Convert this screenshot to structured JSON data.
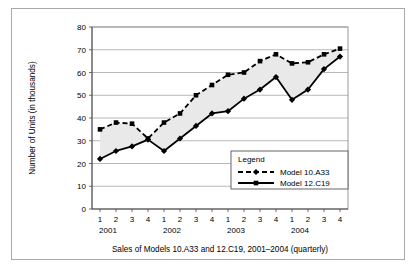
{
  "figure": {
    "caption": "Sales of Models 10.A33 and 12.C19, 2001–2004 (quarterly)",
    "border_color": "#a8a8a8",
    "background": "#ffffff"
  },
  "chart_data": {
    "type": "line",
    "title": "",
    "xlabel": "Sales of Models 10.A33 and 12.C19, 2001–2004 (quarterly)",
    "ylabel": "Number of Units (in thousands)",
    "ylim": [
      0,
      80
    ],
    "ytick_values": [
      0,
      10,
      20,
      30,
      40,
      50,
      60,
      70,
      80
    ],
    "ytick_labels": [
      "0",
      "10",
      "20",
      "30",
      "40",
      "50",
      "60",
      "70",
      "80"
    ],
    "grid": true,
    "grid_axis": "y",
    "legend_position": "lower-right",
    "legend_title": "Legend",
    "x": [
      "1",
      "2",
      "3",
      "4",
      "1",
      "2",
      "3",
      "4",
      "1",
      "2",
      "3",
      "4",
      "1",
      "2",
      "3",
      "4"
    ],
    "xtick_labels": [
      "1",
      "2",
      "3",
      "4",
      "1",
      "2",
      "3",
      "4",
      "1",
      "2",
      "3",
      "4",
      "1",
      "2",
      "3",
      "4"
    ],
    "x_group_labels": [
      "2001",
      "2002",
      "2003",
      "2004"
    ],
    "series": [
      {
        "name": "Model 10.A33",
        "style": "dashed",
        "marker": "diamond",
        "color": "#000000",
        "values": [
          22,
          25.5,
          27.5,
          30.5,
          25.5,
          31,
          36.5,
          42,
          43,
          48.5,
          52.5,
          58,
          48,
          52.5,
          61.5,
          67
        ]
      },
      {
        "name": "Model 12.C19",
        "style": "solid",
        "marker": "square",
        "color": "#000000",
        "values": [
          35,
          38,
          37.5,
          31,
          38,
          42,
          50,
          54.5,
          59,
          60,
          65,
          68,
          64,
          64.5,
          68,
          70.5
        ]
      }
    ],
    "band_fill_color": "#e9e9e9"
  },
  "legend": {
    "title": "Legend",
    "entries": [
      {
        "label": "Model 10.A33",
        "style": "dashed",
        "marker": "diamond"
      },
      {
        "label": "Model 12.C19",
        "style": "solid",
        "marker": "square"
      }
    ]
  },
  "axes": {
    "y_title": "Number of Units (in thousands)",
    "x_caption": "Sales of Models 10.A33 and 12.C19, 2001–2004 (quarterly)"
  }
}
